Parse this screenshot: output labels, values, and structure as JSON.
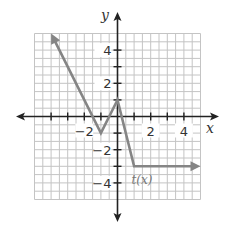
{
  "chart_data": {
    "type": "line",
    "title": "",
    "xlabel": "x",
    "ylabel": "y",
    "xlim": [
      -5,
      5
    ],
    "ylim": [
      -5,
      5
    ],
    "grid": true,
    "grid_step": 0.5,
    "x_tick_labels": [
      {
        "value": -2,
        "label": "−2"
      },
      {
        "value": 2,
        "label": "2"
      },
      {
        "value": 4,
        "label": "4"
      }
    ],
    "y_tick_labels": [
      {
        "value": 4,
        "label": "4"
      },
      {
        "value": 2,
        "label": "2"
      },
      {
        "value": -2,
        "label": "−2"
      },
      {
        "value": -4,
        "label": "−4"
      }
    ],
    "series": [
      {
        "name": "t(x)",
        "x": [
          -4,
          -1,
          0,
          1,
          5
        ],
        "y": [
          5,
          -1,
          1,
          -3,
          -3
        ],
        "arrow_start": true,
        "arrow_end": true
      }
    ],
    "annotations": [
      {
        "text": "t(x)",
        "x": 1.2,
        "y": -3.8
      }
    ]
  },
  "colors": {
    "grid": "#c4c4c4",
    "axes": "#222222",
    "series": "#858585"
  }
}
